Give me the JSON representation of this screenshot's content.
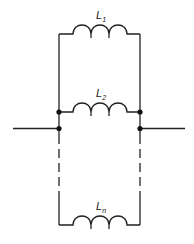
{
  "diagram": {
    "colors": {
      "stroke": "#222222",
      "background": "#ffffff"
    },
    "inductors": [
      {
        "label": "L",
        "subscript": "1"
      },
      {
        "label": "L",
        "subscript": "2"
      },
      {
        "label": "L",
        "subscript": "n"
      }
    ]
  }
}
